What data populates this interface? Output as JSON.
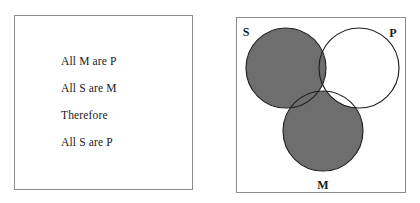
{
  "figure": {
    "name": "categorical-syllogism-venn-figure",
    "background_color": "#ffffff"
  },
  "argument_panel": {
    "name": "argument-box",
    "border_color": "#8d8d8d",
    "lines": [
      {
        "text": "All M are P",
        "role": "major-premise"
      },
      {
        "text": "All S are M",
        "role": "minor-premise"
      },
      {
        "text": "Therefore",
        "role": "inference-marker"
      },
      {
        "text": "All S are P",
        "role": "conclusion"
      }
    ]
  },
  "venn_panel": {
    "name": "venn-diagram-box",
    "border_color": "#8d8d8d",
    "shade_color": "#6e6e6e",
    "outline_color": "#1f1f1f",
    "empty_color": "#ffffff",
    "circles": [
      {
        "id": "S",
        "label": "S",
        "cx": 50,
        "cy": 51,
        "r": 40,
        "label_x": 10,
        "label_y": 19
      },
      {
        "id": "P",
        "label": "P",
        "cx": 123,
        "cy": 51,
        "r": 40,
        "label_x": 157,
        "label_y": 20
      },
      {
        "id": "M",
        "label": "M",
        "cx": 87,
        "cy": 114,
        "r": 40,
        "label_x": 87,
        "label_y": 172
      }
    ],
    "shaded_regions": [
      {
        "id": "S-only",
        "description": "S outside M and outside P",
        "shaded": true
      },
      {
        "id": "S-and-M-only",
        "description": "S intersect M, outside P",
        "shaded": true
      },
      {
        "id": "S-and-P-only",
        "description": "S intersect P, outside M",
        "shaded": true
      },
      {
        "id": "M-only",
        "description": "M outside S and outside P",
        "shaded": true
      },
      {
        "id": "S-and-M-and-P",
        "description": "centre region",
        "shaded": false
      },
      {
        "id": "M-and-P-only",
        "description": "M intersect P, outside S",
        "shaded": false
      },
      {
        "id": "P-only",
        "description": "P outside S and outside M",
        "shaded": false
      }
    ]
  }
}
